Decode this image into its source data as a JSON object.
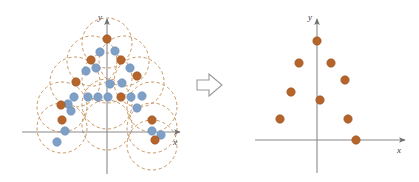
{
  "figure": {
    "background_color": "#ffffff",
    "colors": {
      "orange_point": "#b5642a",
      "orange_point_edge": "#9c5021",
      "blue_point": "#7e9fc6",
      "blue_point_edge": "#6d8fb8",
      "dashed_circle": "#c08a50",
      "axis": "#8a8a8a",
      "axis_label": "#3b3b3b",
      "transform_arrow_outline": "#9a9a9a"
    },
    "point_radius_px": 4.2,
    "left_panel": {
      "name": "source-scatter",
      "origin": [
        107,
        132
      ],
      "axes": {
        "x_label": "x",
        "y_label": "y",
        "x_start": [
          22,
          132
        ],
        "x_end": [
          183,
          132
        ],
        "y_start": [
          107,
          174
        ],
        "y_end": [
          107,
          16
        ],
        "x_label_pos": [
          174,
          144
        ],
        "y_label_pos": [
          99,
          17
        ]
      },
      "dashed_circles": [
        {
          "cx": 107,
          "cy": 43,
          "r": 25
        },
        {
          "cx": 92,
          "cy": 61,
          "r": 25
        },
        {
          "cx": 124,
          "cy": 61,
          "r": 25
        },
        {
          "cx": 75,
          "cy": 82,
          "r": 25
        },
        {
          "cx": 107,
          "cy": 78,
          "r": 25
        },
        {
          "cx": 139,
          "cy": 82,
          "r": 25
        },
        {
          "cx": 62,
          "cy": 107,
          "r": 25
        },
        {
          "cx": 107,
          "cy": 104,
          "r": 25
        },
        {
          "cx": 152,
          "cy": 107,
          "r": 25
        },
        {
          "cx": 62,
          "cy": 128,
          "r": 25
        },
        {
          "cx": 152,
          "cy": 128,
          "r": 25
        },
        {
          "cx": 107,
          "cy": 125,
          "r": 25
        },
        {
          "cx": 152,
          "cy": 145,
          "r": 25
        }
      ],
      "orange_points": [
        [
          107,
          39
        ],
        [
          91,
          60
        ],
        [
          121,
          60
        ],
        [
          137,
          76
        ],
        [
          76,
          82
        ],
        [
          121,
          97
        ],
        [
          61,
          105
        ],
        [
          62,
          120
        ],
        [
          152,
          120
        ],
        [
          155,
          140
        ]
      ],
      "blue_points": [
        [
          100,
          52
        ],
        [
          115,
          51
        ],
        [
          96,
          68
        ],
        [
          130,
          68
        ],
        [
          86,
          71
        ],
        [
          110,
          84
        ],
        [
          122,
          83
        ],
        [
          88,
          97
        ],
        [
          98,
          97
        ],
        [
          108,
          97
        ],
        [
          131,
          97
        ],
        [
          142,
          96
        ],
        [
          74,
          97
        ],
        [
          68,
          104
        ],
        [
          71,
          111
        ],
        [
          137,
          108
        ],
        [
          65,
          131
        ],
        [
          152,
          131
        ],
        [
          57,
          142
        ],
        [
          161,
          135
        ]
      ]
    },
    "transform_arrow": {
      "name": "transform-arrow",
      "direction": "right",
      "x": 197,
      "y": 72,
      "width": 30,
      "height": 26
    },
    "right_panel": {
      "name": "result-scatter",
      "origin": [
        317,
        140
      ],
      "axes": {
        "x_label": "x",
        "y_label": "y",
        "x_start": [
          255,
          140
        ],
        "x_end": [
          408,
          140
        ],
        "y_start": [
          317,
          173
        ],
        "y_end": [
          317,
          16
        ],
        "x_label_pos": [
          398,
          152
        ],
        "y_label_pos": [
          309,
          17
        ]
      },
      "orange_points": [
        [
          317,
          41
        ],
        [
          299,
          63
        ],
        [
          331,
          63
        ],
        [
          345,
          80
        ],
        [
          291,
          92
        ],
        [
          320,
          100
        ],
        [
          280,
          119
        ],
        [
          348,
          119
        ],
        [
          356,
          140
        ]
      ]
    }
  },
  "chart_data": {
    "type": "scatter",
    "xlabel": "x",
    "ylabel": "y",
    "grid": false,
    "legend": null,
    "panels": [
      {
        "name": "left",
        "caption": "points with dashed covering circles",
        "series": [
          {
            "name": "centers",
            "color": "#b5642a",
            "marker": "circle",
            "count": 10,
            "points_px": [
              [
                107,
                39
              ],
              [
                91,
                60
              ],
              [
                121,
                60
              ],
              [
                137,
                76
              ],
              [
                76,
                82
              ],
              [
                121,
                97
              ],
              [
                61,
                105
              ],
              [
                62,
                120
              ],
              [
                152,
                120
              ],
              [
                155,
                140
              ]
            ]
          },
          {
            "name": "members",
            "color": "#7e9fc6",
            "marker": "circle",
            "count": 20,
            "points_px": [
              [
                100,
                52
              ],
              [
                115,
                51
              ],
              [
                96,
                68
              ],
              [
                130,
                68
              ],
              [
                86,
                71
              ],
              [
                110,
                84
              ],
              [
                122,
                83
              ],
              [
                88,
                97
              ],
              [
                98,
                97
              ],
              [
                108,
                97
              ],
              [
                131,
                97
              ],
              [
                142,
                96
              ],
              [
                74,
                97
              ],
              [
                68,
                104
              ],
              [
                71,
                111
              ],
              [
                137,
                108
              ],
              [
                65,
                131
              ],
              [
                152,
                131
              ],
              [
                57,
                142
              ],
              [
                161,
                135
              ]
            ]
          }
        ],
        "circles": {
          "name": "covering-circles",
          "style": "dashed",
          "color": "#c08a50",
          "radius_px": 25,
          "count": 13
        }
      },
      {
        "name": "right",
        "caption": "retained cluster centers only",
        "series": [
          {
            "name": "centers",
            "color": "#b5642a",
            "marker": "circle",
            "count": 9,
            "points_px": [
              [
                317,
                41
              ],
              [
                299,
                63
              ],
              [
                331,
                63
              ],
              [
                345,
                80
              ],
              [
                291,
                92
              ],
              [
                320,
                100
              ],
              [
                280,
                119
              ],
              [
                348,
                119
              ],
              [
                356,
                140
              ]
            ]
          }
        ]
      }
    ]
  }
}
